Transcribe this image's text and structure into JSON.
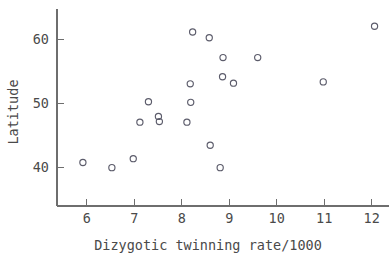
{
  "chart_data": {
    "type": "scatter",
    "title": "",
    "xlabel": "Dizygotic twinning rate/1000",
    "ylabel": "Latitude",
    "xlim": [
      5.35,
      12.45
    ],
    "ylim": [
      35.5,
      63.8
    ],
    "grid": false,
    "legend": null,
    "xticks": [
      6,
      7,
      8,
      9,
      10,
      11,
      12
    ],
    "xtick_labels": [
      "6",
      "7",
      "8",
      "9",
      "10",
      "11",
      "12"
    ],
    "yticks": [
      40,
      50,
      60
    ],
    "ytick_labels": [
      "40",
      "50",
      "60"
    ],
    "marker": "open-circle",
    "marker_color": "#5c5c6b",
    "points": [
      {
        "x": 5.92,
        "y": 40.7
      },
      {
        "x": 6.53,
        "y": 39.9
      },
      {
        "x": 6.98,
        "y": 41.3
      },
      {
        "x": 7.12,
        "y": 47.0
      },
      {
        "x": 7.3,
        "y": 50.2
      },
      {
        "x": 7.51,
        "y": 47.9
      },
      {
        "x": 7.53,
        "y": 47.1
      },
      {
        "x": 8.11,
        "y": 47.0
      },
      {
        "x": 8.18,
        "y": 53.0
      },
      {
        "x": 8.19,
        "y": 50.1
      },
      {
        "x": 8.23,
        "y": 61.1
      },
      {
        "x": 8.58,
        "y": 60.2
      },
      {
        "x": 8.6,
        "y": 43.4
      },
      {
        "x": 8.81,
        "y": 39.9
      },
      {
        "x": 8.86,
        "y": 54.1
      },
      {
        "x": 8.87,
        "y": 57.1
      },
      {
        "x": 9.09,
        "y": 53.1
      },
      {
        "x": 9.6,
        "y": 57.1
      },
      {
        "x": 10.98,
        "y": 53.3
      },
      {
        "x": 12.06,
        "y": 62.0
      }
    ]
  },
  "figure": {
    "background_color": "#ffffff",
    "axis_color": "#6e6e6e",
    "text_color": "#4a4a4a"
  }
}
